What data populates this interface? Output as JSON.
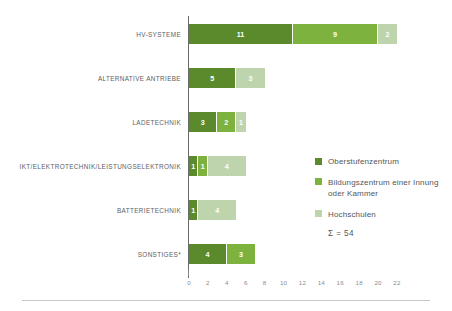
{
  "chart_data": {
    "type": "bar",
    "orientation": "horizontal",
    "stacked": true,
    "title": "",
    "subtitle": "",
    "xlabel": "",
    "ylabel": "",
    "xlim": [
      0,
      22
    ],
    "xticks": [
      0,
      2,
      4,
      6,
      8,
      10,
      12,
      14,
      16,
      18,
      20,
      22
    ],
    "grid": false,
    "legend_position": "right",
    "categories": [
      "HV-SYSTEME",
      "ALTERNATIVE ANTRIEBE",
      "LADETECHNIK",
      "IKT/ELEKTROTECHNIK/LEISTUNGSELEKTRONIK",
      "BATTERIETECHNIK",
      "SONSTIGES*"
    ],
    "series": [
      {
        "name": "Oberstufenzentrum",
        "color": "#5b8a2c",
        "values": [
          11,
          5,
          3,
          1,
          1,
          4
        ]
      },
      {
        "name": "Bildungszentrum einer Innung oder Kammer",
        "color": "#7eb23e",
        "values": [
          9,
          0,
          2,
          1,
          0,
          3
        ]
      },
      {
        "name": "Hochschulen",
        "color": "#bed4ac",
        "values": [
          2,
          3,
          1,
          4,
          4,
          0
        ]
      }
    ],
    "totals": [
      22,
      8,
      6,
      6,
      5,
      7
    ],
    "sum_annotation": "Σ = 54",
    "sum_value": 54
  },
  "legend": {
    "items": [
      {
        "label": "Oberstufenzentrum",
        "color": "#5b8a2c"
      },
      {
        "label": "Bildungszentrum einer Innung oder Kammer",
        "color": "#7eb23e"
      },
      {
        "label": "Hochschulen",
        "color": "#bed4ac"
      }
    ],
    "sum_text": "Σ = 54"
  },
  "axis": {
    "ticks": [
      "0",
      "2",
      "4",
      "6",
      "8",
      "10",
      "12",
      "14",
      "16",
      "18",
      "20",
      "22"
    ]
  },
  "rows": [
    {
      "label": "HV-SYSTEME",
      "segments": [
        {
          "value": "11",
          "series": "Oberstufenzentrum"
        },
        {
          "value": "9",
          "series": "Bildungszentrum einer Innung oder Kammer"
        },
        {
          "value": "2",
          "series": "Hochschulen"
        }
      ]
    },
    {
      "label": "ALTERNATIVE ANTRIEBE",
      "segments": [
        {
          "value": "5",
          "series": "Oberstufenzentrum"
        },
        {
          "value": "3",
          "series": "Hochschulen"
        }
      ]
    },
    {
      "label": "LADETECHNIK",
      "segments": [
        {
          "value": "3",
          "series": "Oberstufenzentrum"
        },
        {
          "value": "2",
          "series": "Bildungszentrum einer Innung oder Kammer"
        },
        {
          "value": "1",
          "series": "Hochschulen"
        }
      ]
    },
    {
      "label": "IKT/ELEKTROTECHNIK/LEISTUNGSELEKTRONIK",
      "segments": [
        {
          "value": "1",
          "series": "Oberstufenzentrum"
        },
        {
          "value": "1",
          "series": "Bildungszentrum einer Innung oder Kammer"
        },
        {
          "value": "4",
          "series": "Hochschulen"
        }
      ]
    },
    {
      "label": "BATTERIETECHNIK",
      "segments": [
        {
          "value": "1",
          "series": "Oberstufenzentrum"
        },
        {
          "value": "4",
          "series": "Hochschulen"
        }
      ]
    },
    {
      "label": "SONSTIGES*",
      "segments": [
        {
          "value": "4",
          "series": "Oberstufenzentrum"
        },
        {
          "value": "3",
          "series": "Bildungszentrum einer Innung oder Kammer"
        }
      ]
    }
  ]
}
